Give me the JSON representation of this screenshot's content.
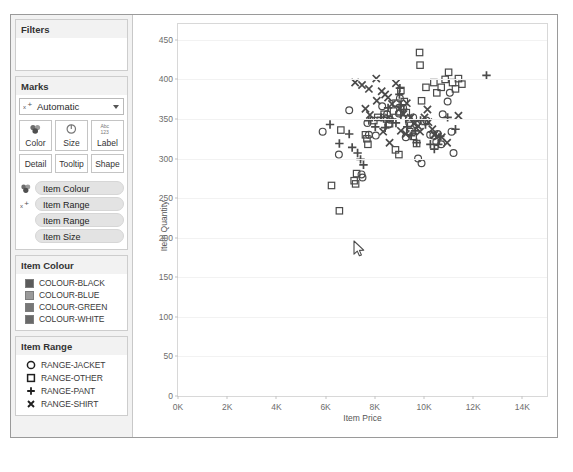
{
  "filters": {
    "title": "Filters"
  },
  "marks": {
    "title": "Marks",
    "type_select": {
      "value": "Automatic",
      "icon": "shape-mark-icon",
      "caret": "chevron-down-icon"
    },
    "buttons": [
      {
        "label": "Color",
        "icon": "color-palette-icon"
      },
      {
        "label": "Size",
        "icon": "size-circle-icon"
      },
      {
        "label": "Label",
        "icon": "label-abc-icon"
      }
    ],
    "buttons2": [
      {
        "label": "Detail"
      },
      {
        "label": "Tooltip"
      },
      {
        "label": "Shape"
      }
    ],
    "shelves": [
      {
        "icon": "color-palette-icon",
        "label": "Item Colour",
        "indent": false
      },
      {
        "icon": "shape-mark-icon",
        "label": "Item Range",
        "indent": false
      },
      {
        "icon": "",
        "label": "Item Range",
        "indent": true
      },
      {
        "icon": "",
        "label": "Item Size",
        "indent": true
      }
    ]
  },
  "legend_colour": {
    "title": "Item Colour",
    "items": [
      {
        "label": "COLOUR-BLACK",
        "color": "#5b5b5b"
      },
      {
        "label": "COLOUR-BLUE",
        "color": "#9a9a9a"
      },
      {
        "label": "COLOUR-GREEN",
        "color": "#777777"
      },
      {
        "label": "COLOUR-WHITE",
        "color": "#696969"
      }
    ]
  },
  "legend_range": {
    "title": "Item Range",
    "items": [
      {
        "label": "RANGE-JACKET",
        "shape": "circle-icon"
      },
      {
        "label": "RANGE-OTHER",
        "shape": "square-icon"
      },
      {
        "label": "RANGE-PANT",
        "shape": "plus-icon"
      },
      {
        "label": "RANGE-SHIRT",
        "shape": "cross-x-icon"
      }
    ]
  },
  "cursor": {
    "icon": "mouse-pointer-icon",
    "x": 353,
    "y": 240
  },
  "chart_data": {
    "type": "scatter",
    "title": "",
    "xlabel": "Item Price",
    "ylabel": "Item Quantity",
    "xlim": [
      0,
      15000
    ],
    "ylim": [
      0,
      470
    ],
    "xticks": [
      0,
      2000,
      4000,
      6000,
      8000,
      10000,
      12000,
      14000
    ],
    "xticklabels": [
      "0K",
      "2K",
      "4K",
      "6K",
      "8K",
      "10K",
      "12K",
      "14K"
    ],
    "yticks": [
      0,
      50,
      100,
      150,
      200,
      250,
      300,
      350,
      400,
      450
    ],
    "yticklabels": [
      "0",
      "50",
      "100",
      "150",
      "200",
      "250",
      "300",
      "350",
      "400",
      "450"
    ],
    "grid": "horizontal",
    "legend_position": "left-panel",
    "series": [
      {
        "name": "RANGE-JACKET",
        "shape": "circle",
        "points": [
          [
            5880,
            334
          ],
          [
            6540,
            305
          ],
          [
            6960,
            361
          ],
          [
            7700,
            345
          ],
          [
            7760,
            330
          ],
          [
            8040,
            329
          ],
          [
            8300,
            366
          ],
          [
            8380,
            352
          ],
          [
            8500,
            356
          ],
          [
            8560,
            343
          ],
          [
            8620,
            349
          ],
          [
            8980,
            357
          ],
          [
            9020,
            376
          ],
          [
            9150,
            364
          ],
          [
            9260,
            327
          ],
          [
            9400,
            345
          ],
          [
            9560,
            352
          ],
          [
            9680,
            343
          ],
          [
            9760,
            300
          ],
          [
            10100,
            348
          ],
          [
            10250,
            330
          ],
          [
            10380,
            329
          ],
          [
            10500,
            321
          ],
          [
            10560,
            331
          ],
          [
            10700,
            318
          ],
          [
            10760,
            356
          ],
          [
            10960,
            372
          ],
          [
            11050,
            383
          ],
          [
            11200,
            307
          ],
          [
            7460,
            280
          ],
          [
            7500,
            276
          ],
          [
            9900,
            294
          ],
          [
            11120,
            334
          ]
        ]
      },
      {
        "name": "RANGE-OTHER",
        "shape": "square",
        "points": [
          [
            6240,
            266
          ],
          [
            6560,
            234
          ],
          [
            6620,
            336
          ],
          [
            7160,
            272
          ],
          [
            7220,
            268
          ],
          [
            7260,
            281
          ],
          [
            7620,
            330
          ],
          [
            7680,
            325
          ],
          [
            7720,
            318
          ],
          [
            7960,
            348
          ],
          [
            8120,
            352
          ],
          [
            8380,
            356
          ],
          [
            8480,
            350
          ],
          [
            8600,
            344
          ],
          [
            8760,
            360
          ],
          [
            8860,
            370
          ],
          [
            9060,
            386
          ],
          [
            9200,
            372
          ],
          [
            9280,
            358
          ],
          [
            9380,
            350
          ],
          [
            9420,
            334
          ],
          [
            9560,
            328
          ],
          [
            9700,
            319
          ],
          [
            9900,
            373
          ],
          [
            10080,
            390
          ],
          [
            10400,
            396
          ],
          [
            10520,
            383
          ],
          [
            10700,
            390
          ],
          [
            10860,
            400
          ],
          [
            11000,
            409
          ],
          [
            11160,
            396
          ],
          [
            11280,
            388
          ],
          [
            11400,
            401
          ],
          [
            11540,
            394
          ],
          [
            9840,
            418
          ],
          [
            9820,
            434
          ],
          [
            8840,
            311
          ],
          [
            8980,
            305
          ]
        ]
      },
      {
        "name": "RANGE-PANT",
        "shape": "plus",
        "points": [
          [
            6180,
            343
          ],
          [
            6560,
            319
          ],
          [
            6960,
            331
          ],
          [
            7080,
            314
          ],
          [
            7300,
            307
          ],
          [
            7420,
            299
          ],
          [
            7540,
            292
          ],
          [
            7760,
            348
          ],
          [
            8020,
            340
          ],
          [
            8260,
            352
          ],
          [
            8420,
            339
          ],
          [
            8540,
            364
          ],
          [
            8700,
            350
          ],
          [
            8860,
            345
          ],
          [
            9060,
            355
          ],
          [
            9180,
            362
          ],
          [
            9320,
            340
          ],
          [
            9480,
            329
          ],
          [
            9640,
            335
          ],
          [
            9700,
            320
          ],
          [
            9860,
            348
          ],
          [
            10060,
            343
          ],
          [
            10260,
            318
          ],
          [
            10420,
            312
          ],
          [
            10580,
            318
          ],
          [
            10660,
            328
          ],
          [
            10960,
            352
          ],
          [
            11280,
            337
          ],
          [
            12540,
            405
          ],
          [
            9000,
            381
          ],
          [
            9020,
            389
          ],
          [
            9060,
            368
          ]
        ]
      },
      {
        "name": "RANGE-SHIRT",
        "shape": "cross",
        "points": [
          [
            7200,
            396
          ],
          [
            7480,
            393
          ],
          [
            7760,
            388
          ],
          [
            7620,
            363
          ],
          [
            7800,
            355
          ],
          [
            8080,
            373
          ],
          [
            8280,
            385
          ],
          [
            8420,
            381
          ],
          [
            8540,
            377
          ],
          [
            8700,
            369
          ],
          [
            8860,
            395
          ],
          [
            9000,
            363
          ],
          [
            9160,
            356
          ],
          [
            9300,
            370
          ],
          [
            9460,
            352
          ],
          [
            9600,
            344
          ],
          [
            9760,
            341
          ],
          [
            9840,
            334
          ],
          [
            10020,
            352
          ],
          [
            10180,
            346
          ],
          [
            10340,
            337
          ],
          [
            10420,
            330
          ],
          [
            10560,
            328
          ],
          [
            10720,
            327
          ],
          [
            10940,
            320
          ],
          [
            11400,
            354
          ],
          [
            8060,
            401
          ],
          [
            10140,
            362
          ],
          [
            9060,
            335
          ],
          [
            9260,
            331
          ],
          [
            8600,
            320
          ],
          [
            8340,
            334
          ]
        ]
      }
    ]
  }
}
